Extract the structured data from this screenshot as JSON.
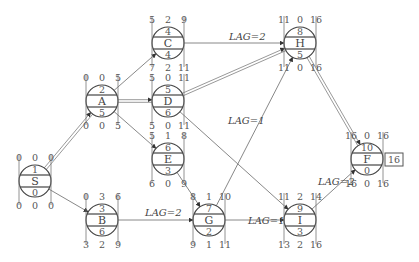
{
  "diagram": {
    "type": "precedence-network",
    "nodes": [
      {
        "id": "S",
        "x": 35,
        "y": 181,
        "top": "1",
        "bottom": "0",
        "es": "0",
        "tf": "0",
        "ef": "0",
        "ls": "0",
        "ff": "0",
        "lf": "0",
        "critical": true
      },
      {
        "id": "A",
        "x": 102,
        "y": 101,
        "top": "2",
        "bottom": "5",
        "es": "0",
        "tf": "0",
        "ef": "5",
        "ls": "0",
        "ff": "0",
        "lf": "5",
        "critical": true
      },
      {
        "id": "B",
        "x": 102,
        "y": 220,
        "top": "3",
        "bottom": "6",
        "es": "0",
        "tf": "3",
        "ef": "6",
        "ls": "3",
        "ff": "2",
        "lf": "9",
        "critical": false
      },
      {
        "id": "C",
        "x": 168,
        "y": 43,
        "top": "4",
        "bottom": "4",
        "es": "5",
        "tf": "2",
        "ef": "9",
        "ls": "7",
        "ff": "2",
        "lf": "11",
        "critical": false
      },
      {
        "id": "D",
        "x": 168,
        "y": 101,
        "top": "5",
        "bottom": "6",
        "es": "5",
        "tf": "0",
        "ef": "11",
        "ls": "5",
        "ff": "0",
        "lf": "11",
        "critical": true
      },
      {
        "id": "E",
        "x": 168,
        "y": 159,
        "top": "6",
        "bottom": "3",
        "es": "5",
        "tf": "1",
        "ef": "8",
        "ls": "6",
        "ff": "0",
        "lf": "9",
        "critical": false
      },
      {
        "id": "G",
        "x": 209,
        "y": 220,
        "top": "7",
        "bottom": "2",
        "es": "8",
        "tf": "1",
        "ef": "10",
        "ls": "9",
        "ff": "1",
        "lf": "11",
        "critical": false
      },
      {
        "id": "H",
        "x": 300,
        "y": 43,
        "top": "8",
        "bottom": "5",
        "es": "11",
        "tf": "0",
        "ef": "16",
        "ls": "11",
        "ff": "0",
        "lf": "16",
        "critical": true
      },
      {
        "id": "I",
        "x": 300,
        "y": 220,
        "top": "9",
        "bottom": "3",
        "es": "11",
        "tf": "2",
        "ef": "14",
        "ls": "13",
        "ff": "2",
        "lf": "16",
        "critical": false
      },
      {
        "id": "F",
        "x": 367,
        "y": 159,
        "top": "10",
        "bottom": "0",
        "es": "16",
        "tf": "0",
        "ef": "16",
        "ls": "16",
        "ff": "0",
        "lf": "16",
        "critical": true
      }
    ],
    "edges": [
      {
        "from": "S",
        "to": "A",
        "critical": true,
        "lag": ""
      },
      {
        "from": "S",
        "to": "B",
        "critical": false,
        "lag": ""
      },
      {
        "from": "A",
        "to": "C",
        "critical": false,
        "lag": ""
      },
      {
        "from": "A",
        "to": "D",
        "critical": true,
        "lag": ""
      },
      {
        "from": "A",
        "to": "E",
        "critical": false,
        "lag": ""
      },
      {
        "from": "C",
        "to": "H",
        "critical": false,
        "lag": "LAG=2"
      },
      {
        "from": "D",
        "to": "H",
        "critical": true,
        "lag": ""
      },
      {
        "from": "D",
        "to": "I",
        "critical": false,
        "lag": "LAG=1"
      },
      {
        "from": "E",
        "to": "G",
        "critical": false,
        "lag": ""
      },
      {
        "from": "B",
        "to": "G",
        "critical": false,
        "lag": "LAG=2"
      },
      {
        "from": "G",
        "to": "H",
        "critical": false,
        "lag": ""
      },
      {
        "from": "G",
        "to": "I",
        "critical": false,
        "lag": "LAG=1"
      },
      {
        "from": "H",
        "to": "F",
        "critical": true,
        "lag": ""
      },
      {
        "from": "I",
        "to": "F",
        "critical": false,
        "lag": "LAG=2"
      }
    ],
    "lag_labels": [
      {
        "text": "LAG=2",
        "x": 229,
        "y": 40
      },
      {
        "text": "LAG=1",
        "x": 228,
        "y": 124
      },
      {
        "text": "LAG=2",
        "x": 145,
        "y": 216
      },
      {
        "text": "LAG=1",
        "x": 248,
        "y": 224
      },
      {
        "text": "LAG=2",
        "x": 318,
        "y": 185
      }
    ],
    "project_duration": "16",
    "colors": {
      "line": "#888888",
      "critical_line": "#999999",
      "node_stroke": "#444444",
      "text": "#555555"
    }
  }
}
